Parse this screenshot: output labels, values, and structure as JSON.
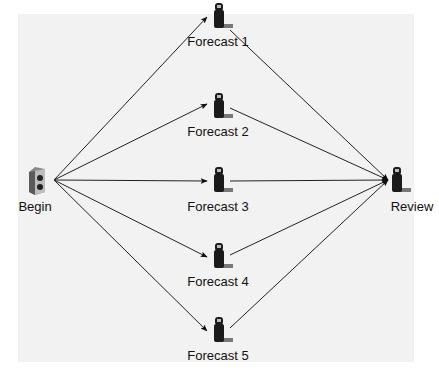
{
  "diagram": {
    "type": "workflow",
    "colors": {
      "background": "#ffffff",
      "panel": "#f2f2f2",
      "edge": "#222222",
      "icon": "#1a1a1a"
    },
    "nodes": [
      {
        "id": "begin",
        "label": "Begin",
        "icon": "server-icon",
        "x": 36,
        "y": 180
      },
      {
        "id": "f1",
        "label": "Forecast 1",
        "icon": "person-icon",
        "x": 218,
        "y": 14
      },
      {
        "id": "f2",
        "label": "Forecast 2",
        "icon": "person-icon",
        "x": 218,
        "y": 102
      },
      {
        "id": "f3",
        "label": "Forecast 3",
        "icon": "person-icon",
        "x": 218,
        "y": 180
      },
      {
        "id": "f4",
        "label": "Forecast 4",
        "icon": "person-icon",
        "x": 218,
        "y": 258
      },
      {
        "id": "f5",
        "label": "Forecast 5",
        "icon": "person-icon",
        "x": 218,
        "y": 326
      },
      {
        "id": "review",
        "label": "Review",
        "icon": "person-icon",
        "x": 400,
        "y": 180
      }
    ],
    "edges": [
      {
        "from": "begin",
        "to": "f1"
      },
      {
        "from": "begin",
        "to": "f2"
      },
      {
        "from": "begin",
        "to": "f3"
      },
      {
        "from": "begin",
        "to": "f4"
      },
      {
        "from": "begin",
        "to": "f5"
      },
      {
        "from": "f1",
        "to": "review"
      },
      {
        "from": "f2",
        "to": "review"
      },
      {
        "from": "f3",
        "to": "review"
      },
      {
        "from": "f4",
        "to": "review"
      },
      {
        "from": "f5",
        "to": "review"
      }
    ]
  }
}
